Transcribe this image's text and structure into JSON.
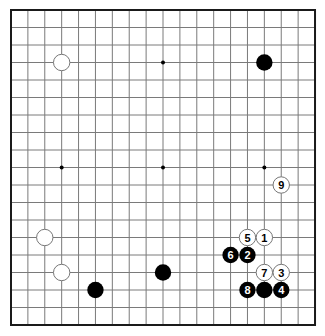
{
  "board": {
    "size": 19,
    "origin": {
      "x": 11,
      "y": 10
    },
    "spacing": {
      "x": 16.89,
      "y": 17.5
    },
    "colors": {
      "background": "#ffffff",
      "grid_line": "#7a7a7a",
      "border": "#1a1a1a",
      "black_stone": "#000000",
      "white_stone_fill": "#ffffff",
      "white_stone_outline": "#777777",
      "black_label": "#ffffff",
      "white_label": "#000000"
    },
    "star_points": [
      {
        "col": 3,
        "row": 3
      },
      {
        "col": 9,
        "row": 3
      },
      {
        "col": 15,
        "row": 3
      },
      {
        "col": 3,
        "row": 9
      },
      {
        "col": 9,
        "row": 9
      },
      {
        "col": 15,
        "row": 9
      },
      {
        "col": 3,
        "row": 15
      },
      {
        "col": 9,
        "row": 15
      },
      {
        "col": 15,
        "row": 15
      }
    ]
  },
  "stones": [
    {
      "color": "white",
      "col": 3,
      "row": 3,
      "label": ""
    },
    {
      "color": "black",
      "col": 15,
      "row": 3,
      "label": ""
    },
    {
      "color": "white",
      "col": 16,
      "row": 10,
      "label": "9"
    },
    {
      "color": "white",
      "col": 2,
      "row": 13,
      "label": ""
    },
    {
      "color": "white",
      "col": 14,
      "row": 13,
      "label": "5"
    },
    {
      "color": "white",
      "col": 15,
      "row": 13,
      "label": "1"
    },
    {
      "color": "black",
      "col": 13,
      "row": 14,
      "label": "6"
    },
    {
      "color": "black",
      "col": 14,
      "row": 14,
      "label": "2"
    },
    {
      "color": "white",
      "col": 3,
      "row": 15,
      "label": ""
    },
    {
      "color": "black",
      "col": 9,
      "row": 15,
      "label": ""
    },
    {
      "color": "white",
      "col": 15,
      "row": 15,
      "label": "7"
    },
    {
      "color": "white",
      "col": 16,
      "row": 15,
      "label": "3"
    },
    {
      "color": "black",
      "col": 5,
      "row": 16,
      "label": ""
    },
    {
      "color": "black",
      "col": 14,
      "row": 16,
      "label": "8"
    },
    {
      "color": "black",
      "col": 15,
      "row": 16,
      "label": ""
    },
    {
      "color": "black",
      "col": 16,
      "row": 16,
      "label": "4"
    }
  ]
}
